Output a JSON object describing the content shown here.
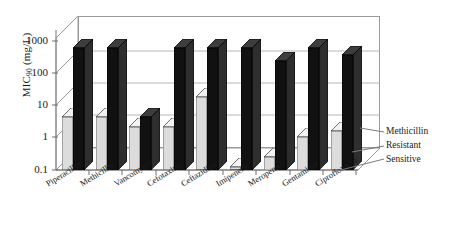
{
  "chart_data": {
    "type": "bar",
    "title": "",
    "xlabel": "",
    "ylabel": "MIC90 (mg/L)",
    "ylabel_main": "MIC",
    "ylabel_sub": "90",
    "ylabel_unit": " (mg/L)",
    "log_scale": true,
    "ylim": [
      0.1,
      1000
    ],
    "yticks": [
      "1000",
      "100",
      "10",
      "1",
      "0.1"
    ],
    "ytick_values": [
      1000,
      100,
      10,
      1,
      0.1
    ],
    "grid": true,
    "legend_position": "right",
    "three_d": true,
    "categories": [
      "Piperacillin",
      "Methicillin",
      "Vancomycin",
      "Cefotaxime",
      "Ceftazidime",
      "Imipenem",
      "Meropenem",
      "Gentamicin",
      "Ciprofloxacin"
    ],
    "series": [
      {
        "name": "Sensitive",
        "color": "#dcdcdc",
        "values": [
          4,
          4,
          2,
          2,
          16,
          0.12,
          0.25,
          1,
          1.5
        ]
      },
      {
        "name": "Methicillin Resistant",
        "color": "#111111",
        "values": [
          500,
          500,
          4,
          500,
          500,
          500,
          200,
          500,
          300
        ]
      }
    ],
    "legend": [
      {
        "label": "Methicillin"
      },
      {
        "label": "Resistant"
      },
      {
        "label": "Sensitive"
      }
    ]
  }
}
